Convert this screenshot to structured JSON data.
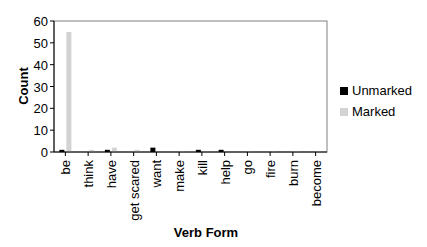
{
  "chart_data": {
    "type": "bar",
    "title": "",
    "xlabel": "Verb Form",
    "ylabel": "Count",
    "ylim": [
      0,
      60
    ],
    "yticks": [
      0,
      10,
      20,
      30,
      40,
      50,
      60
    ],
    "grid": false,
    "legend_position": "right",
    "categories": [
      "be",
      "think",
      "have",
      "get scared",
      "want",
      "make",
      "kill",
      "help",
      "go",
      "fire",
      "burn",
      "become"
    ],
    "series": [
      {
        "name": "Unmarked",
        "color": "#000000",
        "values": [
          1,
          0,
          1,
          0,
          2,
          0,
          1,
          1,
          0,
          0,
          0,
          0
        ]
      },
      {
        "name": "Marked",
        "color": "#d3d3d3",
        "values": [
          55,
          1,
          2,
          1,
          0,
          0.5,
          0,
          0,
          0.5,
          0.5,
          0.5,
          0.5
        ]
      }
    ]
  },
  "legend": {
    "items": [
      {
        "label": "Unmarked",
        "color": "#000000"
      },
      {
        "label": "Marked",
        "color": "#d3d3d3"
      }
    ]
  }
}
